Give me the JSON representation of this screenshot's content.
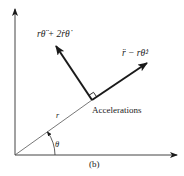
{
  "figure": {
    "caption": "(b)",
    "colors": {
      "ink": "#1a1a1a",
      "thin_line": "#555555",
      "background": "#ffffff"
    }
  },
  "labels": {
    "transverse_acceleration": "rθ̈ + 2ṙθ̇",
    "radial_acceleration": "r̈ − rθ̇²",
    "accelerations": "Accelerations",
    "radius": "r",
    "angle": "θ"
  },
  "geometry": {
    "origin": [
      15,
      155
    ],
    "y_axis_tip": [
      15,
      8
    ],
    "x_axis_tip": [
      178,
      155
    ],
    "vector_base": [
      92,
      100
    ],
    "radial_vector_tip": [
      148,
      62
    ],
    "transverse_vector_tip": [
      55,
      45
    ]
  }
}
